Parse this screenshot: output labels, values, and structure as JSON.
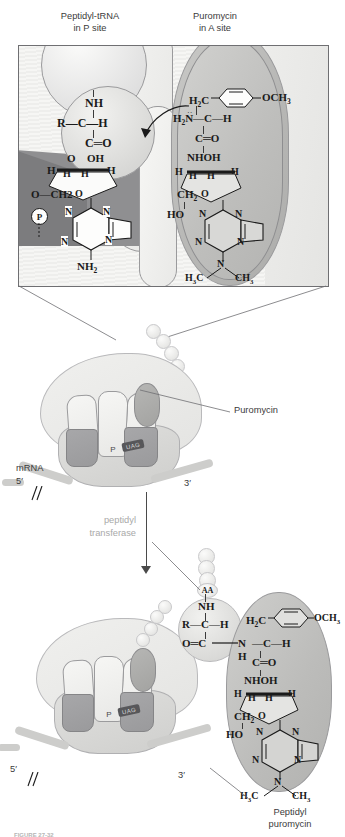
{
  "figure": {
    "headers": {
      "left_line1": "Peptidyl-tRNA",
      "left_line2": "in P site",
      "right_line1": "Puromycin",
      "right_line2": "in A site"
    },
    "inset_chemistry": {
      "peptidyl_trna": {
        "amide_nh": "NH",
        "alpha_carbon": "R—C—H",
        "carbonyl": "C═O",
        "ribose_top_left": "O",
        "ribose_top_right": "OH",
        "ribose_h_left": "H",
        "ribose_h_right": "H",
        "ribose_h_inner_left": "H",
        "ribose_h_inner_right": "H",
        "ribose_ring_o": "O",
        "c5_link": "O—CH2",
        "phosphate": "P",
        "base_n1": "N",
        "base_n2": "N",
        "base_n3": "N",
        "base_n4": "N",
        "base_amino": "NH2"
      },
      "puromycin": {
        "methylene": "H2C",
        "methoxy": "OCH3",
        "amino": "H2N",
        "alpha_carbon": "—C—H",
        "carbonyl": "C═O",
        "amide_nhoh": "NHOH",
        "ribose_h_left": "H",
        "ribose_h_right": "H",
        "ribose_h_inner_left": "H",
        "ribose_h_inner_right": "H",
        "ribose_ring_o": "O",
        "c5_ch2": "CH2",
        "c5_oh": "HO",
        "base_n1": "N",
        "base_n2": "N",
        "base_n3": "N",
        "base_n4": "N",
        "dimethylamine_n": "N",
        "methyl_left": "H3C",
        "methyl_right": "CH3"
      }
    },
    "ribosome_top": {
      "site_e": "E",
      "site_p": "P",
      "site_a": "A",
      "codon": "UAG",
      "mrna_label": "mRNA",
      "five_prime": "5′",
      "three_prime": "3′",
      "puromycin_callout": "Puromycin"
    },
    "reaction_arrow": {
      "label_line1": "peptidyl",
      "label_line2": "transferase"
    },
    "ribosome_bottom": {
      "site_e": "E",
      "site_p": "P",
      "site_a": "A",
      "codon": "UAG",
      "five_prime": "5′",
      "three_prime": "3′"
    },
    "product_chemistry": {
      "aa_bead": "AA",
      "amide_nh": "NH",
      "alpha_carbon": "R—C—H",
      "carbonyl": "O═C",
      "peptide_bond_n": "N",
      "peptide_bond_h": "H",
      "methylene": "H2C",
      "methoxy": "OCH3",
      "puro_alpha": "—C—H",
      "puro_carbonyl": "C═O",
      "amide_nhoh": "NHOH",
      "ribose_h_left": "H",
      "ribose_h_right": "H",
      "ribose_h_inner_left": "H",
      "ribose_h_inner_right": "H",
      "ribose_ring_o": "O",
      "c5_ch2": "CH2",
      "c5_oh": "HO",
      "base_n1": "N",
      "base_n2": "N",
      "base_n3": "N",
      "base_n4": "N",
      "dimethylamine_n": "N",
      "methyl_left": "H3C",
      "methyl_right": "CH3"
    },
    "product_label": {
      "line1": "Peptidyl",
      "line2": "puromycin"
    },
    "caption": "FIGURE 27-32",
    "colors": {
      "panel_border": "#6f6f72",
      "puromycin_fill": "#bebebc",
      "psite_dark": "#8f8f91",
      "ribosome_light": "#ebebe9",
      "ribosome_dark": "#a0a0a2",
      "mrna": "#cdcdcb",
      "text": "#231f20",
      "label_grey": "#a9a9a9"
    }
  }
}
